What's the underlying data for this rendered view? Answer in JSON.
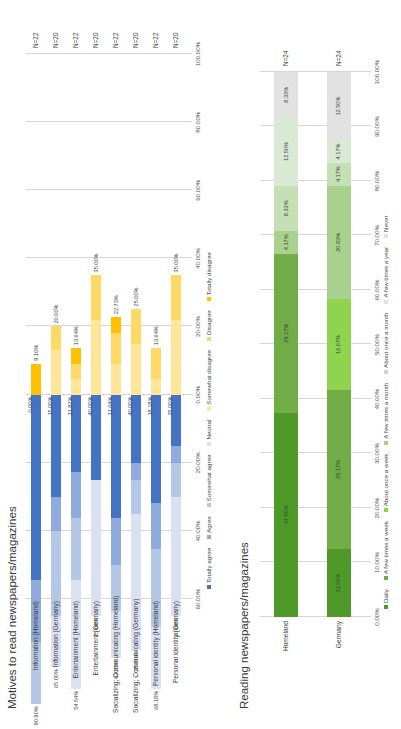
{
  "page": {
    "background": "#ffffff",
    "orientation": "rotated-90-ccw"
  },
  "charts": [
    {
      "id": "motives",
      "title": "Motives to read newspapers/magazines"
    },
    {
      "id": "reading",
      "title": "Reading newspapers/magazines"
    }
  ],
  "chart_data": [
    {
      "type": "bar",
      "subtype": "diverging-stacked-bar",
      "title": "Motives to read newspapers/magazines",
      "xlabel": "",
      "ylabel": "",
      "grid": true,
      "legend_position": "bottom",
      "axis_ticks": [
        "100.00%",
        "80.00%",
        "60.00%",
        "40.00%",
        "20.00%",
        "0.00%",
        "20.00%",
        "40.00%",
        "60.00%"
      ],
      "axis_range_positive": [
        0,
        100
      ],
      "axis_range_negative": [
        0,
        60
      ],
      "categories": [
        "Information (Homeland)",
        "Information (Germany)",
        "Entertainment (Homeland)",
        "Entertainment (Germany)",
        "Socializing; Communicating (Homeland)",
        "Socializing; Communicating (Germany)",
        "Personal identity (Homeland)",
        "Personal identity (Germany)"
      ],
      "sample_sizes": [
        "N=22",
        "N=20",
        "N=22",
        "N=20",
        "N=22",
        "N=20",
        "N=22",
        "N=20"
      ],
      "top_labels": [
        "90.90%",
        "65.00%",
        "54.54%",
        "25.00%",
        "63.63%",
        "35.00%",
        "68.18%",
        "30.00%"
      ],
      "mid_labels": [
        "0.00%",
        "15.00%",
        "31.82%",
        "40.00%",
        "13.64%",
        "40.00%",
        "18.18%",
        "35.00%"
      ],
      "bottom_labels": [
        "9.10%",
        "20.00%",
        "13.64%",
        "35.00%",
        "22.73%",
        "25.00%",
        "13.64%",
        "35.00%"
      ],
      "legend": [
        {
          "name": "Totally agree",
          "color": "#4472c4"
        },
        {
          "name": "Agree",
          "color": "#8faadc"
        },
        {
          "name": "Somewhat agree",
          "color": "#b4c7e7"
        },
        {
          "name": "Neutral",
          "color": "#d9e2f3"
        },
        {
          "name": "Somewhat disagree",
          "color": "#ffe699"
        },
        {
          "name": "Disagree",
          "color": "#ffd966"
        },
        {
          "name": "Totally disagree",
          "color": "#ffc000"
        }
      ],
      "series": [
        {
          "name": "Totally agree",
          "color": "#4472c4",
          "values": [
            54.54,
            30.0,
            22.72,
            25.0,
            36.36,
            20.0,
            31.82,
            15.0
          ]
        },
        {
          "name": "Agree",
          "color": "#8faadc",
          "values": [
            18.18,
            10.0,
            13.64,
            0.0,
            13.64,
            5.0,
            13.64,
            5.0
          ]
        },
        {
          "name": "Somewhat agree",
          "color": "#b4c7e7",
          "values": [
            18.18,
            25.0,
            18.18,
            0.0,
            13.63,
            10.0,
            22.72,
            10.0
          ]
        },
        {
          "name": "Neutral",
          "color": "#d9e2f3",
          "values": [
            0.0,
            15.0,
            31.82,
            40.0,
            13.64,
            40.0,
            18.18,
            35.0
          ]
        },
        {
          "name": "Somewhat disagree",
          "color": "#ffe699",
          "values": [
            0.0,
            13.0,
            4.55,
            22.0,
            9.09,
            15.0,
            4.55,
            22.0
          ]
        },
        {
          "name": "Disagree",
          "color": "#ffd966",
          "values": [
            0.0,
            7.0,
            4.55,
            13.0,
            9.09,
            10.0,
            9.09,
            13.0
          ]
        },
        {
          "name": "Totally disagree",
          "color": "#ffc000",
          "values": [
            9.1,
            0.0,
            4.54,
            0.0,
            4.55,
            0.0,
            0.0,
            0.0
          ]
        }
      ]
    },
    {
      "type": "bar",
      "subtype": "stacked-bar-100",
      "title": "Reading newspapers/magazines",
      "xlabel": "",
      "ylabel": "",
      "grid": true,
      "legend_position": "bottom",
      "axis_ticks": [
        "0.00%",
        "10.00%",
        "20.00%",
        "30.00%",
        "40.00%",
        "50.00%",
        "60.00%",
        "70.00%",
        "80.00%",
        "90.00%",
        "100.00%"
      ],
      "ylim": [
        0,
        100
      ],
      "categories": [
        "Homeland",
        "Germany"
      ],
      "sample_sizes": [
        "N=24",
        "N=24"
      ],
      "legend": [
        {
          "name": "Daily",
          "color": "#4e9a28"
        },
        {
          "name": "A few times a week",
          "color": "#70ad47"
        },
        {
          "name": "About once a week",
          "color": "#8ed44f"
        },
        {
          "name": "A few times a month",
          "color": "#a9d18e"
        },
        {
          "name": "About once a month",
          "color": "#c5e0b4"
        },
        {
          "name": "A few times a year",
          "color": "#dae9d4"
        },
        {
          "name": "Never",
          "color": "#e2e2e2"
        }
      ],
      "series": [
        {
          "name": "Daily",
          "color": "#4e9a28",
          "values": [
            37.5,
            12.5
          ]
        },
        {
          "name": "A few times a week",
          "color": "#70ad47",
          "values": [
            29.17,
            29.17
          ]
        },
        {
          "name": "About once a week",
          "color": "#8ed44f",
          "values": [
            0.0,
            16.67
          ]
        },
        {
          "name": "A few times a month",
          "color": "#a9d18e",
          "values": [
            4.17,
            20.83
          ]
        },
        {
          "name": "About once a month",
          "color": "#c5e0b4",
          "values": [
            8.33,
            4.17
          ]
        },
        {
          "name": "A few times a year",
          "color": "#dae9d4",
          "values": [
            12.5,
            4.17
          ]
        },
        {
          "name": "Never",
          "color": "#e2e2e2",
          "values": [
            8.33,
            12.5
          ]
        }
      ],
      "bar_labels": [
        [
          "37.50%",
          "29.17%",
          "",
          "4.17%",
          "8.33%",
          "4.17%",
          "8.33%",
          "8.33%"
        ],
        [
          "12.50%",
          "29.17%",
          "16.67%",
          "20.83%",
          "4.17%",
          "4.17%",
          "12.50%"
        ]
      ],
      "homeland_labels": [
        "37.50%",
        "29.17%",
        "4.17%",
        "8.33%",
        "4.17%",
        "8.33%",
        "8.33%"
      ],
      "germany_labels": [
        "12.50%",
        "29.17%",
        "16.67%",
        "20.83%",
        "4.17%",
        "4.17%",
        "12.50%"
      ]
    }
  ]
}
